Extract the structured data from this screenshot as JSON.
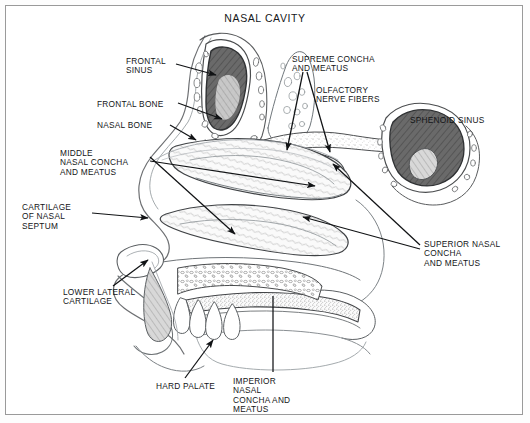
{
  "figure": {
    "title": "NASAL CAVITY",
    "domain_note": "anatomical line illustration, midsagittal section of the nasal cavity",
    "frame_color": "#9a9a9a",
    "ink_color": "#1a1c1e",
    "paper_color": "#ffffff"
  },
  "labels": [
    {
      "id": "frontal-sinus",
      "text": "FRONTAL\nSINUS",
      "x": 126,
      "y": 57,
      "align": "left"
    },
    {
      "id": "frontal-bone",
      "text": "FRONTAL BONE",
      "x": 97,
      "y": 100,
      "align": "left"
    },
    {
      "id": "nasal-bone",
      "text": "NASAL BONE",
      "x": 97,
      "y": 121,
      "align": "left"
    },
    {
      "id": "middle-nasal-concha",
      "text": "MIDDLE\nNASAL CONCHA\nAND MEATUS",
      "x": 60,
      "y": 149,
      "align": "left"
    },
    {
      "id": "cartilage-nasal-septum",
      "text": "CARTILAGE\nOF NASAL\nSEPTUM",
      "x": 22,
      "y": 203,
      "align": "left"
    },
    {
      "id": "lower-lateral-cartilage",
      "text": "LOWER LATERAL\nCARTILAGE",
      "x": 63,
      "y": 288,
      "align": "left"
    },
    {
      "id": "hard-palate",
      "text": "HARD PALATE",
      "x": 156,
      "y": 382,
      "align": "left"
    },
    {
      "id": "imperior-nasal-concha",
      "text": "IMPERIOR\nNASAL\nCONCHA AND\nMEATUS",
      "x": 233,
      "y": 377,
      "align": "left"
    },
    {
      "id": "supreme-concha",
      "text": "SUPREME CONCHA\nAND MEATUS",
      "x": 292,
      "y": 55,
      "align": "left"
    },
    {
      "id": "olfactory-nerve-fibers",
      "text": "OLFACTORY\nNERVE FIBERS",
      "x": 316,
      "y": 86,
      "align": "left"
    },
    {
      "id": "sphenoid-sinus",
      "text": "SPHENOID SINUS",
      "x": 410,
      "y": 116,
      "align": "left"
    },
    {
      "id": "superior-nasal-concha",
      "text": "SUPERIOR NASAL\nCONCHA\nAND MEATUS",
      "x": 424,
      "y": 240,
      "align": "left"
    }
  ],
  "leaders": [
    {
      "id": "leader-frontal-sinus",
      "from": [
        176,
        64
      ],
      "to": [
        216,
        75
      ],
      "arrow": true
    },
    {
      "id": "leader-frontal-bone",
      "from": [
        178,
        103
      ],
      "to": [
        222,
        119
      ],
      "arrow": true
    },
    {
      "id": "leader-nasal-bone",
      "from": [
        170,
        125
      ],
      "to": [
        196,
        140
      ],
      "arrow": true
    },
    {
      "id": "leader-middle-nasal-concha",
      "from": [
        150,
        157
      ],
      "to": [
        235,
        234
      ],
      "arrow": true
    },
    {
      "id": "leader-cartilage-septum",
      "from": [
        92,
        213
      ],
      "to": [
        148,
        218
      ],
      "arrow": true
    },
    {
      "id": "leader-lower-lateral-cartilage",
      "from": [
        113,
        286
      ],
      "to": [
        148,
        260
      ],
      "arrow": true
    },
    {
      "id": "leader-hard-palate",
      "from": [
        185,
        378
      ],
      "to": [
        213,
        340
      ],
      "arrow": true
    },
    {
      "id": "leader-imperior-nasal-concha",
      "from": [
        273,
        372
      ],
      "to": [
        273,
        296
      ],
      "arrow": false
    },
    {
      "id": "leader-supreme-concha-a",
      "from": [
        303,
        72
      ],
      "to": [
        287,
        150
      ],
      "arrow": true
    },
    {
      "id": "leader-supreme-concha-b",
      "from": [
        307,
        72
      ],
      "to": [
        330,
        152
      ],
      "arrow": true
    },
    {
      "id": "leader-superior-concha-a",
      "from": [
        420,
        245
      ],
      "to": [
        333,
        164
      ],
      "arrow": true
    },
    {
      "id": "leader-superior-concha-b",
      "from": [
        420,
        249
      ],
      "to": [
        303,
        217
      ],
      "arrow": true
    },
    {
      "id": "leader-middle-concha-b",
      "from": [
        150,
        161
      ],
      "to": [
        315,
        186
      ],
      "arrow": true
    }
  ]
}
